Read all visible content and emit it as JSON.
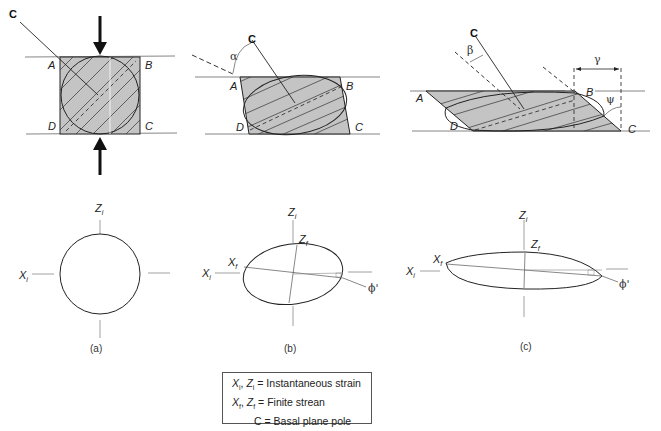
{
  "figure": {
    "panels": [
      {
        "id": "a",
        "caption": "(a)",
        "corners": [
          "A",
          "B",
          "C",
          "D"
        ],
        "pole_label": "C",
        "angle_label": null
      },
      {
        "id": "b",
        "caption": "(b)",
        "corners": [
          "A",
          "B",
          "C",
          "D"
        ],
        "pole_label": "C",
        "angle_label": "α"
      },
      {
        "id": "c",
        "caption": "(c)",
        "corners": [
          "A",
          "B",
          "C",
          "D"
        ],
        "pole_label": "C",
        "angle_labels": [
          "β",
          "γ",
          "ψ"
        ]
      }
    ],
    "axes_labels": {
      "xi": "X",
      "xi_sub": "i",
      "zi": "Z",
      "zi_sub": "i",
      "xf": "X",
      "xf_sub": "f",
      "zf": "Z",
      "zf_sub": "f",
      "phi": "ϕ'"
    },
    "colors": {
      "fill": "#c4c4c4",
      "stroke": "#222222",
      "thin": "#777777"
    }
  },
  "legend": {
    "line1_x": "X",
    "line1_xsub": "i",
    "line1_z": "Z",
    "line1_zsub": "i",
    "line1_text": " = Instantaneous strain",
    "line2_x": "X",
    "line2_xsub": "f",
    "line2_z": "Z",
    "line2_zsub": "f",
    "line2_text": " = Finite strean",
    "line3_text": "C = Basal plane pole"
  }
}
